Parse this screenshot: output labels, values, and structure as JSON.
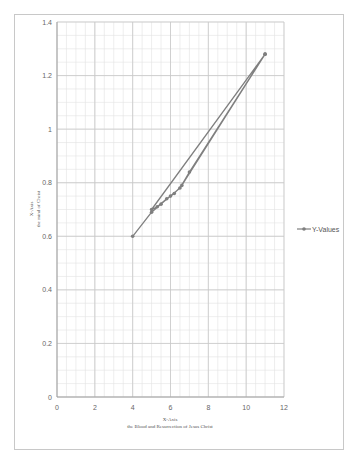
{
  "chart_data": {
    "type": "scatter",
    "title": "",
    "xlabel": "X-Axis\nthe Blood and Resurrection of Jesus Christ",
    "ylabel": "X-Axis\nthe mind of Christ",
    "xlabel_lines": [
      "X-Axis",
      "the Blood and Resurrection of Jesus Christ"
    ],
    "ylabel_lines": [
      "X-Axis",
      "the mind of Christ"
    ],
    "xlim": [
      0,
      12
    ],
    "ylim": [
      0,
      1.4
    ],
    "xticks": [
      0,
      2,
      4,
      6,
      8,
      10,
      12
    ],
    "yticks": [
      0,
      0.2,
      0.4,
      0.6,
      0.8,
      1,
      1.2,
      1.4
    ],
    "xtick_labels": [
      "0",
      "2",
      "4",
      "6",
      "8",
      "10",
      "12"
    ],
    "ytick_labels": [
      "0",
      "0.2",
      "0.4",
      "0.6",
      "0.8",
      "1",
      "1.2",
      "1.4"
    ],
    "grid": true,
    "legend_position": "right",
    "series": [
      {
        "name": "Y-Values",
        "style": "line-with-markers",
        "color": "#7f7f7f",
        "x": [
          4,
          5,
          5.5,
          6,
          6.5,
          7,
          11,
          5,
          5.3,
          5.8,
          6.2,
          6.6,
          11
        ],
        "y": [
          0.6,
          0.69,
          0.72,
          0.75,
          0.78,
          0.84,
          1.28,
          0.7,
          0.71,
          0.74,
          0.76,
          0.79,
          1.28
        ]
      }
    ]
  },
  "legend": {
    "label": "Y-Values"
  },
  "colors": {
    "line": "#7f7f7f",
    "grid_major": "#c8c8c8",
    "grid_minor": "#e2e2e2",
    "border": "#c8c8c8"
  }
}
